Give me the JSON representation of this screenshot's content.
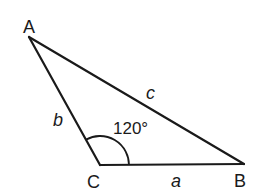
{
  "figure": {
    "type": "triangle",
    "stroke_color": "#1a1a1a",
    "vertices": {
      "A": {
        "label": "A",
        "x": 29,
        "y": 37
      },
      "B": {
        "label": "B",
        "x": 244,
        "y": 164
      },
      "C": {
        "label": "C",
        "x": 100,
        "y": 165
      }
    },
    "sides": {
      "a": {
        "label": "a",
        "between": "C-B"
      },
      "b": {
        "label": "b",
        "between": "A-C"
      },
      "c": {
        "label": "c",
        "between": "A-B"
      }
    },
    "angle": {
      "vertex": "C",
      "label": "120°",
      "value_degrees": 120
    }
  }
}
